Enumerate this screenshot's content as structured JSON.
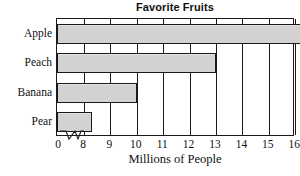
{
  "chart_data": {
    "type": "bar",
    "orientation": "horizontal",
    "title": "Favorite Fruits",
    "xlabel": "Millions of People",
    "ylabel": "",
    "categories": [
      "Apple",
      "Peach",
      "Banana",
      "Pear"
    ],
    "values": [
      16.4,
      13.0,
      10.0,
      8.3
    ],
    "xticks": [
      "0",
      "8",
      "9",
      "10",
      "11",
      "12",
      "13",
      "14",
      "15",
      "16"
    ],
    "xtick_values": [
      0,
      8,
      9,
      10,
      11,
      12,
      13,
      14,
      15,
      16
    ],
    "xlim": [
      8,
      17
    ],
    "axis_break": true,
    "axis_break_between": [
      0,
      8
    ],
    "grid": true,
    "grid_axis": "x",
    "legend": false,
    "bar_fill_color": "#d2d2d2",
    "bar_edge_color": "#1a1a1a",
    "background_color": "#ffffff",
    "text_color": "#111111"
  }
}
